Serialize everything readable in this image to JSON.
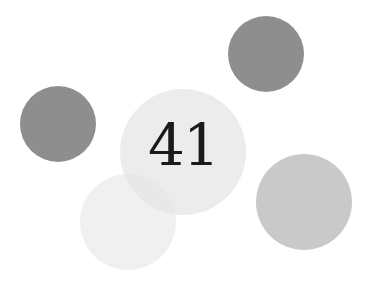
{
  "label": "41",
  "circles": [
    {
      "name": "circle-top-right",
      "cx": 266,
      "cy": 54,
      "r": 38,
      "color": "#8e8e8e",
      "opacity": 1
    },
    {
      "name": "circle-left",
      "cx": 58,
      "cy": 124,
      "r": 38,
      "color": "#8e8e8e",
      "opacity": 1
    },
    {
      "name": "circle-bottom-left",
      "cx": 128,
      "cy": 222,
      "r": 48,
      "color": "#e6e6e6",
      "opacity": 0.6
    },
    {
      "name": "circle-center",
      "cx": 183,
      "cy": 152,
      "r": 63,
      "color": "#e4e4e4",
      "opacity": 0.7
    },
    {
      "name": "circle-bottom-right",
      "cx": 304,
      "cy": 202,
      "r": 48,
      "color": "#c9c9c9",
      "opacity": 1
    }
  ]
}
